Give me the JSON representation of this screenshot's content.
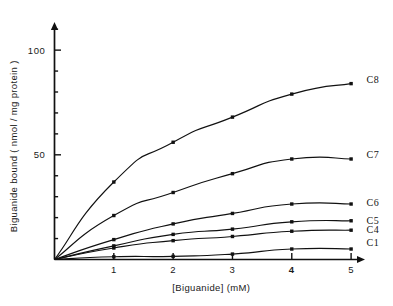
{
  "chart_data": {
    "type": "line",
    "title": "",
    "subtitle": "",
    "xlabel": "[Biguanide]  (mM)",
    "ylabel": "Biguanide  bound  ( nmol / mg protein )",
    "x": [
      0,
      1,
      2,
      3,
      4,
      5
    ],
    "xlim": [
      0,
      5.15
    ],
    "ylim": [
      0,
      112
    ],
    "xticks": [
      1,
      2,
      3,
      4,
      5
    ],
    "xticklabels": [
      "1",
      "2",
      "3",
      "4",
      "5"
    ],
    "yticks": [
      50,
      100
    ],
    "yticklabels": [
      "50",
      "100"
    ],
    "yminorticks": [
      10,
      20,
      30,
      40,
      60,
      70,
      80,
      90,
      110
    ],
    "grid": false,
    "legend_position": "right-of-axes-inline",
    "marker": "filled-square",
    "line_color": "#111111",
    "series": [
      {
        "name": "C8",
        "label": "C8",
        "values": [
          0,
          37,
          56,
          68,
          79,
          84
        ]
      },
      {
        "name": "C7",
        "label": "C7",
        "values": [
          0,
          21,
          32,
          41,
          48,
          48
        ]
      },
      {
        "name": "C6",
        "label": "C6",
        "values": [
          0,
          9.5,
          17,
          22,
          26.5,
          26.5
        ]
      },
      {
        "name": "C5",
        "label": "C5",
        "values": [
          0,
          6.5,
          12,
          14.5,
          18,
          18.5
        ]
      },
      {
        "name": "C4",
        "label": "C4",
        "values": [
          0,
          5.5,
          9,
          11,
          13.5,
          14
        ]
      },
      {
        "name": "C1",
        "label": "C1",
        "values": [
          0,
          1.3,
          1.5,
          2.6,
          5,
          5
        ]
      }
    ],
    "series_label_positions": [
      {
        "name": "C8",
        "y_value": 86
      },
      {
        "name": "C7",
        "y_value": 50
      },
      {
        "name": "C6",
        "y_value": 27
      },
      {
        "name": "C5",
        "y_value": 18.5
      },
      {
        "name": "C4",
        "y_value": 14.5
      },
      {
        "name": "C1",
        "y_value": 8
      }
    ]
  }
}
